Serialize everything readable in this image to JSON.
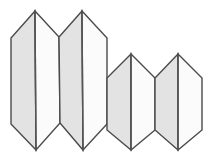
{
  "figure": {
    "canvas": {
      "width": 218,
      "height": 166
    },
    "background_color": "#ffffff",
    "style": {
      "left_face_fill": "#e3e3e3",
      "right_face_fill": "#fbfbfb",
      "outline_color": "#4a4a4a",
      "outline_width": 1.4,
      "ridge_color": "#555555",
      "ridge_width": 1.4
    },
    "shape_count": 4,
    "shapes": [
      {
        "name": "prism-1",
        "index": 1,
        "apex_top": [
          35,
          11
        ],
        "apex_bottom": [
          36,
          150
        ],
        "left_top": [
          11,
          38
        ],
        "left_bottom": [
          11,
          124
        ],
        "right_top": [
          59,
          37
        ],
        "right_bottom": [
          60,
          123
        ],
        "ridge_top": [
          35,
          11
        ],
        "ridge_bottom": [
          36,
          150
        ]
      },
      {
        "name": "prism-2",
        "index": 2,
        "apex_top": [
          82,
          11
        ],
        "apex_bottom": [
          83,
          150
        ],
        "left_top": [
          59,
          37
        ],
        "left_bottom": [
          60,
          123
        ],
        "right_top": [
          107,
          38
        ],
        "right_bottom": [
          107,
          124
        ],
        "ridge_top": [
          82,
          11
        ],
        "ridge_bottom": [
          83,
          150
        ]
      },
      {
        "name": "prism-3",
        "index": 3,
        "apex_top": [
          131,
          54
        ],
        "apex_bottom": [
          131,
          150
        ],
        "left_top": [
          107,
          78
        ],
        "left_bottom": [
          107,
          130
        ],
        "right_top": [
          155,
          78
        ],
        "right_bottom": [
          155,
          130
        ],
        "ridge_top": [
          131,
          54
        ],
        "ridge_bottom": [
          131,
          150
        ]
      },
      {
        "name": "prism-4",
        "index": 4,
        "apex_top": [
          178,
          54
        ],
        "apex_bottom": [
          178,
          150
        ],
        "left_top": [
          155,
          78
        ],
        "left_bottom": [
          155,
          130
        ],
        "right_top": [
          202,
          78
        ],
        "right_bottom": [
          202,
          130
        ],
        "ridge_top": [
          178,
          54
        ],
        "ridge_bottom": [
          178,
          150
        ]
      }
    ]
  }
}
